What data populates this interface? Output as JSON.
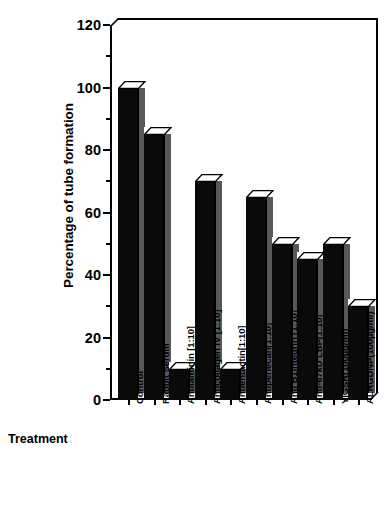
{
  "chart_data": {
    "type": "bar",
    "title": "",
    "xlabel": "Treatment",
    "ylabel": "Percentage of tube formation",
    "ylim": [
      0,
      120
    ],
    "yticks": [
      0,
      20,
      40,
      60,
      80,
      100,
      120
    ],
    "ytick_labels": [
      "0",
      "20",
      "40",
      "60",
      "80",
      "100",
      "120"
    ],
    "minor_tick_step": 10,
    "grid": false,
    "legend": null,
    "categories": [
      "Control",
      "Rabbit  Serum",
      "Antilaminin  [1:10]",
      "Anticollagen  IV  [1:10]",
      "Antientactin[1:10]",
      "Antiperlecan[1:10]",
      "Anti  B1integrin  [1:10]",
      "Anti-67kD  LBP[1:10]",
      "YIGSR(100µg/ml)",
      "ALRGDNP(100µg/ml)"
    ],
    "values": [
      100,
      85,
      10,
      70,
      10,
      65,
      50,
      45,
      50,
      30
    ],
    "bar_style": {
      "front_color": "#0a0a0a",
      "side_color": "#58585a",
      "top_color": "#ffffff",
      "edge_color": "#000000",
      "three_d_offset_px": 7
    }
  },
  "axis": {
    "x_title": "Treatment",
    "y_title": "Percentage of tube formation"
  }
}
